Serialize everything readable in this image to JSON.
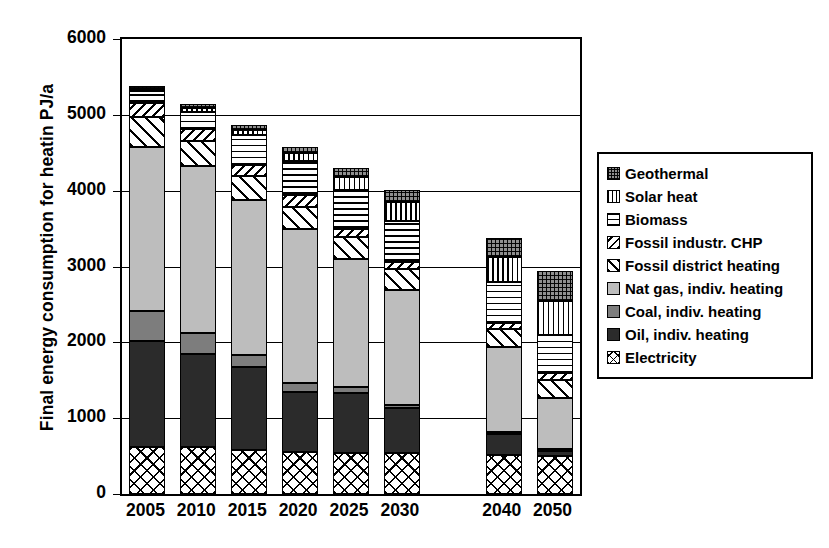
{
  "chart_data": {
    "type": "bar",
    "stacked": true,
    "title": "",
    "xlabel": "",
    "ylabel": "Final energy consumption for heatin PJ/a",
    "ylim": [
      0,
      6000
    ],
    "ytick_labels": [
      "0",
      "1000",
      "2000",
      "3000",
      "4000",
      "5000",
      "6000"
    ],
    "ytick_values": [
      0,
      1000,
      2000,
      3000,
      4000,
      5000,
      6000
    ],
    "grid": true,
    "legend_position": "right",
    "categories": [
      "2005",
      "2010",
      "2015",
      "2020",
      "2025",
      "2030",
      "2040",
      "2050"
    ],
    "category_gap_after": "2030",
    "series": [
      {
        "name": "Electricity",
        "pattern": "p-electricity",
        "values": [
          620,
          620,
          580,
          560,
          545,
          540,
          520,
          500
        ]
      },
      {
        "name": "Oil, indiv. heating",
        "pattern": "p-oil",
        "values": [
          1400,
          1230,
          1090,
          790,
          790,
          600,
          270,
          70
        ]
      },
      {
        "name": "Coal, indiv. heating",
        "pattern": "p-coal",
        "values": [
          390,
          270,
          160,
          120,
          70,
          40,
          30,
          20
        ]
      },
      {
        "name": "Nat gas, indiv. heating",
        "pattern": "p-natgas",
        "values": [
          2170,
          2200,
          2050,
          2030,
          1700,
          1510,
          1120,
          680
        ]
      },
      {
        "name": "Fossil district heating",
        "pattern": "p-fossildh",
        "values": [
          390,
          330,
          310,
          290,
          290,
          280,
          240,
          240
        ]
      },
      {
        "name": "Fossil industr. CHP",
        "pattern": "p-fossilchp",
        "values": [
          180,
          160,
          150,
          150,
          100,
          90,
          80,
          80
        ]
      },
      {
        "name": "Biomass",
        "pattern": "p-biomass",
        "values": [
          170,
          230,
          400,
          450,
          520,
          540,
          530,
          510
        ]
      },
      {
        "name": "Solar heat",
        "pattern": "p-solar",
        "values": [
          20,
          50,
          60,
          110,
          170,
          250,
          340,
          440
        ]
      },
      {
        "name": "Geothermal",
        "pattern": "p-geothermal",
        "values": [
          40,
          50,
          60,
          80,
          110,
          160,
          240,
          400
        ]
      }
    ],
    "totals": [
      5380,
      5140,
      4860,
      4580,
      4295,
      4010,
      3370,
      2940
    ],
    "legend_entries": [
      {
        "label": "Geothermal",
        "pattern": "p-geothermal"
      },
      {
        "label": "Solar heat",
        "pattern": "p-solar"
      },
      {
        "label": "Biomass",
        "pattern": "p-biomass"
      },
      {
        "label": "Fossil industr. CHP",
        "pattern": "p-fossilchp"
      },
      {
        "label": "Fossil district heating",
        "pattern": "p-fossildh"
      },
      {
        "label": "Nat gas, indiv. heating",
        "pattern": "p-natgas"
      },
      {
        "label": "Coal, indiv. heating",
        "pattern": "p-coal"
      },
      {
        "label": "Oil, indiv. heating",
        "pattern": "p-oil"
      },
      {
        "label": "Electricity",
        "pattern": "p-electricity"
      }
    ]
  },
  "colors": {
    "nat_gas": "#bdbdbd",
    "coal": "#7d7d7d",
    "oil": "#2b2b2b",
    "geothermal": "#8f8f8f",
    "axis": "#000000",
    "background": "#ffffff"
  }
}
